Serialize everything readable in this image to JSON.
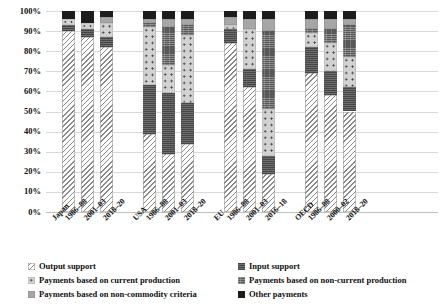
{
  "chart_data": {
    "type": "bar",
    "subtype": "100% stacked bar",
    "title": "",
    "xlabel": "",
    "ylabel": "",
    "ylim": [
      0,
      100
    ],
    "ytick_labels": [
      "0%",
      "10%",
      "20%",
      "30%",
      "40%",
      "50%",
      "60%",
      "70%",
      "80%",
      "90%",
      "100%"
    ],
    "ytick_values": [
      0,
      10,
      20,
      30,
      40,
      50,
      60,
      70,
      80,
      90,
      100
    ],
    "grid": true,
    "legend_position": "bottom",
    "groups": [
      {
        "name": "Japan",
        "categories": [
          "1986–88",
          "2001–03",
          "2018–20"
        ]
      },
      {
        "name": "USA",
        "categories": [
          "1986–88",
          "2001–03",
          "2018–20"
        ]
      },
      {
        "name": "EU",
        "categories": [
          "1986–88",
          "2001–03",
          "2016–18"
        ]
      },
      {
        "name": "OECD",
        "categories": [
          "1986–88",
          "2000–02",
          "2018–20"
        ]
      }
    ],
    "categories": [
      "Japan 1986–88",
      "Japan 2001–03",
      "Japan 2018–20",
      "USA 1986–88",
      "USA 2001–03",
      "USA 2018–20",
      "EU 1986–88",
      "EU 2001–03",
      "EU 2016–18",
      "OECD 1986–88",
      "OECD 2000–02",
      "OECD 2018–20"
    ],
    "series": [
      {
        "name": "Output support",
        "pattern": "diagonal-hatch",
        "color": "#8a8a8a",
        "values": [
          90,
          87,
          82,
          39,
          29,
          34,
          84,
          62,
          19,
          69,
          58,
          50
        ]
      },
      {
        "name": "Input support",
        "pattern": "dark-gray-solid",
        "color": "#5d5d5d",
        "values": [
          3,
          4,
          5,
          24,
          30,
          20,
          7,
          9,
          9,
          13,
          12,
          12
        ]
      },
      {
        "name": "Payments based on current production",
        "pattern": "light-dotted",
        "color": "#d2d2d2",
        "values": [
          3,
          3,
          7,
          29,
          14,
          34,
          2,
          20,
          23,
          7,
          14,
          15
        ]
      },
      {
        "name": "Payments based on non-current production",
        "pattern": "dark-cross-hatch",
        "color": "#585858",
        "values": [
          0,
          0,
          0,
          2,
          19,
          5,
          0,
          0,
          39,
          2,
          7,
          16
        ]
      },
      {
        "name": "Payments based on non-commodity criteria",
        "pattern": "medium-gray-solid",
        "color": "#a6a6a6",
        "values": [
          0,
          0,
          3,
          2,
          4,
          3,
          4,
          5,
          6,
          5,
          5,
          3
        ]
      },
      {
        "name": "Other payments",
        "pattern": "black-solid",
        "color": "#1c1c1c",
        "values": [
          4,
          6,
          3,
          4,
          4,
          4,
          3,
          4,
          4,
          4,
          4,
          4
        ]
      }
    ]
  },
  "legend": {
    "left_column": [
      {
        "label": "Output support",
        "swatch": "output-support-swatch"
      },
      {
        "label": "Payments based on current production",
        "swatch": "current-production-swatch"
      },
      {
        "label": "Payments based on non-commodity criteria",
        "swatch": "non-commodity-swatch"
      }
    ],
    "right_column": [
      {
        "label": "Input support",
        "swatch": "input-support-swatch"
      },
      {
        "label": "Payments based on non-current production",
        "swatch": "non-current-production-swatch"
      },
      {
        "label": "Other payments",
        "swatch": "other-payments-swatch"
      }
    ]
  }
}
